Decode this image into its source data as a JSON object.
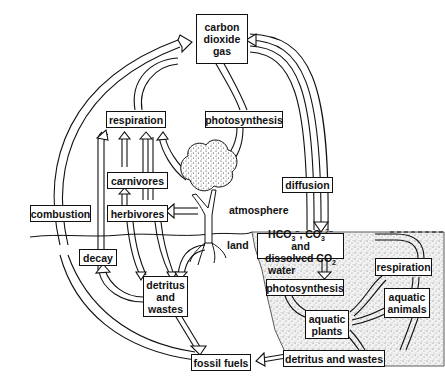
{
  "diagram": {
    "nodes": {
      "co2_gas": {
        "line1": "carbon",
        "line2": "dioxide",
        "line3": "gas"
      },
      "respiration_land": "respiration",
      "photosynthesis_land": "photosynthesis",
      "carnivores": "carnivores",
      "herbivores": "herbivores",
      "combustion": "combustion",
      "diffusion": "diffusion",
      "decay": "decay",
      "detritus_land": {
        "line1": "detritus",
        "line2": "and",
        "line3": "wastes"
      },
      "fossil_fuels": "fossil fuels",
      "dissolved": {
        "hco3": "HCO",
        "hco3_sub": "3",
        "hco3_sup": "−",
        "sep": ", CO",
        "co3_sub": "3",
        "co3_sup": "2−",
        "and": " and",
        "line2": "dissolved CO",
        "co2_sub": "2"
      },
      "photosynthesis_water": "photosynthesis",
      "respiration_water": "respiration",
      "aquatic_plants": {
        "line1": "aquatic",
        "line2": "plants"
      },
      "aquatic_animals": {
        "line1": "aquatic",
        "line2": "animals"
      },
      "detritus_water": "detritus and wastes"
    },
    "labels": {
      "atmosphere": "atmosphere",
      "land": "land",
      "water": "water"
    },
    "edges": [
      {
        "from": "combustion",
        "to": "co2_gas"
      },
      {
        "from": "respiration_land",
        "to": "co2_gas"
      },
      {
        "from": "co2_gas",
        "to": "photosynthesis_land"
      },
      {
        "from": "photosynthesis_land",
        "to": "tree"
      },
      {
        "from": "co2_gas",
        "to": "dissolved",
        "via": "diffusion"
      },
      {
        "from": "dissolved",
        "to": "co2_gas",
        "via": "diffusion"
      },
      {
        "from": "carnivores",
        "to": "respiration_land"
      },
      {
        "from": "herbivores",
        "to": "respiration_land"
      },
      {
        "from": "tree",
        "to": "respiration_land"
      },
      {
        "from": "decay",
        "to": "respiration_land"
      },
      {
        "from": "herbivores",
        "to": "carnivores"
      },
      {
        "from": "tree",
        "to": "herbivores"
      },
      {
        "from": "carnivores",
        "to": "detritus_land"
      },
      {
        "from": "herbivores",
        "to": "detritus_land"
      },
      {
        "from": "tree",
        "to": "detritus_land"
      },
      {
        "from": "detritus_land",
        "to": "decay"
      },
      {
        "from": "detritus_land",
        "to": "fossil_fuels"
      },
      {
        "from": "fossil_fuels",
        "to": "combustion"
      },
      {
        "from": "dissolved",
        "to": "photosynthesis_water"
      },
      {
        "from": "photosynthesis_water",
        "to": "aquatic_plants"
      },
      {
        "from": "aquatic_plants",
        "to": "respiration_water"
      },
      {
        "from": "aquatic_plants",
        "to": "aquatic_animals"
      },
      {
        "from": "aquatic_plants",
        "to": "detritus_water"
      },
      {
        "from": "aquatic_animals",
        "to": "respiration_water"
      },
      {
        "from": "aquatic_animals",
        "to": "detritus_water"
      },
      {
        "from": "respiration_water",
        "to": "dissolved"
      },
      {
        "from": "detritus_water",
        "to": "fossil_fuels"
      }
    ],
    "colors": {
      "ink": "#111111",
      "background": "#ffffff",
      "water_stipple": "#9a9a9a"
    }
  }
}
